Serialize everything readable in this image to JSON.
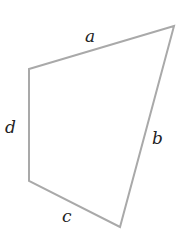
{
  "diagram": {
    "type": "quadrilateral",
    "stroke_color": "#a9a9a9",
    "label_color": "#222222",
    "vertices": {
      "top_left": [
        29,
        69
      ],
      "top_right": [
        174,
        26
      ],
      "bottom_right": [
        120,
        227
      ],
      "bottom_left": [
        29,
        181
      ]
    },
    "sides": [
      {
        "id": "a",
        "label": "a",
        "from": "top_left",
        "to": "top_right"
      },
      {
        "id": "b",
        "label": "b",
        "from": "top_right",
        "to": "bottom_right"
      },
      {
        "id": "c",
        "label": "c",
        "from": "bottom_right",
        "to": "bottom_left"
      },
      {
        "id": "d",
        "label": "d",
        "from": "bottom_left",
        "to": "top_left"
      }
    ]
  }
}
